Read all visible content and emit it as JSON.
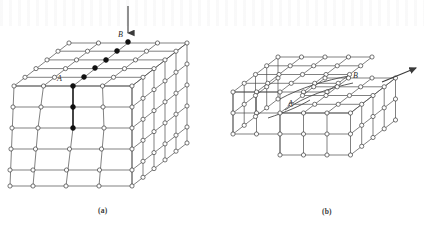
{
  "figure": {
    "background_color": "#ffffff",
    "line_color": "#4a4a4a",
    "node_stroke_color": "#3c3c3c",
    "node_fill_open": "#ffffff",
    "node_fill_solid": "#111111",
    "label_color": "#2b2b2b"
  },
  "panels": [
    {
      "id": "a",
      "caption": "(a)",
      "caption_x": 98,
      "caption_y": 206,
      "description": "Block of crystal lattice with dislocation line AB inside; arrow indicates applied force at B",
      "labels": [
        {
          "name": "label-A",
          "text": "A",
          "x": 57,
          "y": 80
        },
        {
          "name": "label-B",
          "text": "B",
          "x": 118,
          "y": 34
        }
      ],
      "arrow": {
        "name": "applied-force-arrow",
        "direction": "down",
        "x1": 128,
        "y1": 6,
        "x2": 128,
        "y2": 36
      },
      "dislocation_nodes": [
        {
          "x": 128,
          "y": 42
        },
        {
          "x": 117,
          "y": 51
        },
        {
          "x": 106,
          "y": 60
        },
        {
          "x": 95,
          "y": 68
        },
        {
          "x": 84,
          "y": 77
        },
        {
          "x": 73,
          "y": 86
        },
        {
          "x": 73,
          "y": 107
        },
        {
          "x": 73,
          "y": 128
        }
      ],
      "geometry": {
        "front_origin_x": 14,
        "front_origin_y": 86,
        "cell_w": 29.5,
        "cell_h": 21,
        "depth_dx": 11,
        "depth_dy": -8.7,
        "cols": 4,
        "rows": 5,
        "layers": 5
      }
    },
    {
      "id": "b",
      "caption": "(b)",
      "caption_x": 322,
      "caption_y": 207,
      "description": "Slab after dislocation has swept through, leaving a surface step; curved dislocation line from A to B",
      "labels": [
        {
          "name": "label-A",
          "text": "A",
          "x": 290,
          "y": 104
        },
        {
          "name": "label-B",
          "text": "B",
          "x": 355,
          "y": 78
        }
      ],
      "arrow": {
        "name": "slip-direction-arrow",
        "direction": "up-right",
        "x1": 382,
        "y1": 82,
        "x2": 419,
        "y2": 67
      },
      "geometry": {
        "origin_x": 247,
        "origin_y": 98,
        "cell_w": 23.5,
        "cell_h": 21,
        "depth_dx": 15,
        "depth_dy": -11.5,
        "cols": 5,
        "rows": 3,
        "layers": 4
      }
    }
  ]
}
